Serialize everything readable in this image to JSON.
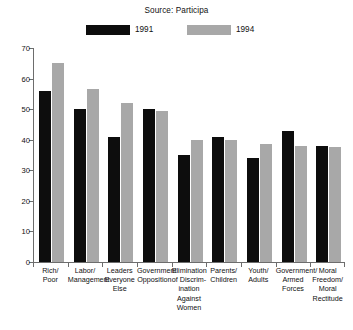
{
  "chart_data": {
    "type": "bar",
    "title": "Source: Participa",
    "xlabel": "",
    "ylabel": "",
    "ylim": [
      0,
      70
    ],
    "yticks": [
      0,
      10,
      20,
      30,
      40,
      50,
      60,
      70
    ],
    "grid": false,
    "legend_position": "top-center",
    "categories": [
      "Rich/\nPoor",
      "Labor/\nManagement",
      "Leaders\nEveryone\nElse",
      "Government\nOpposition",
      "Elimination\nof Discrim-\nination Against\nWomen",
      "Parents/\nChildren",
      "Youth/\nAdults",
      "Government/\nArmed Forces",
      "Moral\nFreedom/\nMoral\nRectitude"
    ],
    "series": [
      {
        "name": "1991",
        "color": "#0d0d0d",
        "values": [
          56,
          50,
          41,
          50,
          35,
          41,
          34,
          43,
          38
        ]
      },
      {
        "name": "1994",
        "color": "#a8a8a8",
        "values": [
          65,
          56.5,
          52,
          49.5,
          40,
          40,
          38.5,
          38,
          37.5
        ]
      }
    ]
  },
  "axis": {
    "y_tick_labels": [
      "0",
      "10",
      "20",
      "30",
      "40",
      "50",
      "60",
      "70"
    ]
  },
  "legend": {
    "entries": [
      {
        "label": "1991",
        "color": "#0d0d0d"
      },
      {
        "label": "1994",
        "color": "#a8a8a8"
      }
    ]
  }
}
